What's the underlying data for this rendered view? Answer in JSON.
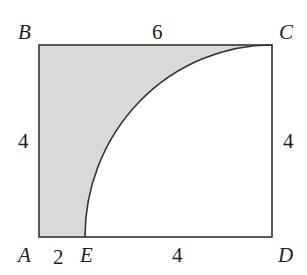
{
  "diagram": {
    "vertices": {
      "A": "A",
      "B": "B",
      "C": "C",
      "D": "D",
      "E": "E"
    },
    "lengths": {
      "top_BC": "6",
      "left_AB": "4",
      "right_CD": "4",
      "bottom_AE": "2",
      "bottom_ED": "4"
    },
    "colors": {
      "shade": "#d9d9d9",
      "stroke": "#333333"
    }
  }
}
